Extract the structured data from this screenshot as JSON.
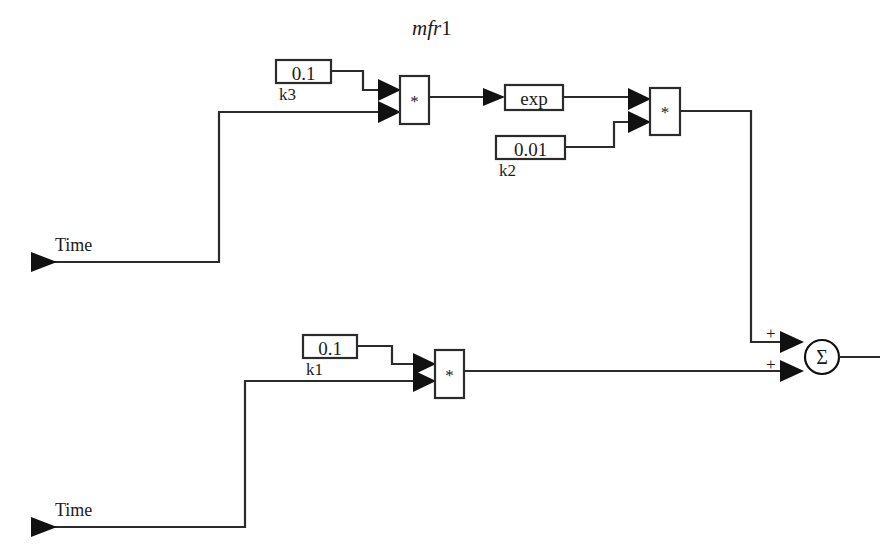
{
  "diagram": {
    "title_italic": "mfr",
    "title_upright": "1",
    "title_full": "mfr1",
    "type": "block-diagram",
    "colors": {
      "wire": "#2b2b2b",
      "block_border": "#2b2b2b",
      "background": "#ffffff",
      "text": "#1b1b1b"
    }
  },
  "inputs": [
    {
      "name": "time-input-upper",
      "label": "Time"
    },
    {
      "name": "time-input-lower",
      "label": "Time"
    }
  ],
  "constants": [
    {
      "name": "k3",
      "value": "0.1",
      "label": "k3"
    },
    {
      "name": "k2",
      "value": "0.01",
      "label": "k2"
    },
    {
      "name": "k1",
      "value": "0.1",
      "label": "k1"
    }
  ],
  "blocks": [
    {
      "name": "product-upper-left",
      "glyph": "*",
      "kind": "product"
    },
    {
      "name": "exp-block",
      "glyph": "exp",
      "kind": "function"
    },
    {
      "name": "product-upper-right",
      "glyph": "*",
      "kind": "product"
    },
    {
      "name": "product-lower",
      "glyph": "*",
      "kind": "product"
    },
    {
      "name": "sum-block",
      "glyph": "Σ",
      "kind": "sum"
    }
  ],
  "sum": {
    "glyph": "Σ",
    "sign_top": "+",
    "sign_bottom": "+"
  }
}
